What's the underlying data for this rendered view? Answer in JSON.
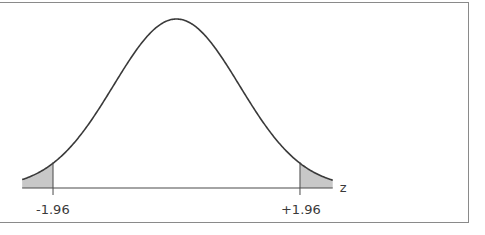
{
  "chart_data": {
    "type": "area",
    "title": "",
    "xlabel": "z",
    "ylabel": "",
    "distribution": "standard normal",
    "mean": 0,
    "sd": 1,
    "xlim": [
      -2.45,
      2.48
    ],
    "critical_values": [
      -1.96,
      1.96
    ],
    "tick_labels": [
      "-1.96",
      "+1.96"
    ],
    "shaded_regions": [
      {
        "from": -2.45,
        "to": -1.96,
        "tail": "left"
      },
      {
        "from": 1.96,
        "to": 2.48,
        "tail": "right"
      }
    ],
    "grid": false,
    "legend": null
  },
  "colors": {
    "curve": "#3a3a3a",
    "shade": "#c8c8c8",
    "axis": "#4a4a4a",
    "frame": "#8a8a8a"
  }
}
